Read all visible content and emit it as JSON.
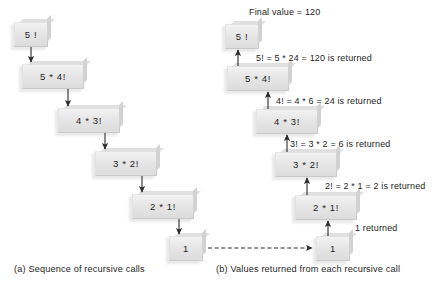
{
  "figure": {
    "title_note": "Final value = 120",
    "panel_a_caption": "(a) Sequence of recursive calls",
    "panel_b_caption": "(b) Values returned from each recursive call"
  },
  "panel_a": {
    "boxes": [
      {
        "label": "5 !"
      },
      {
        "label": "5  *  4!"
      },
      {
        "label": "4  *  3!"
      },
      {
        "label": "3  *  2!"
      },
      {
        "label": "2  *  1!"
      },
      {
        "label": "1"
      }
    ]
  },
  "panel_b": {
    "boxes": [
      {
        "label": "5 !"
      },
      {
        "label": "5  *  4!"
      },
      {
        "label": "4  *  3!"
      },
      {
        "label": "3  *  2!"
      },
      {
        "label": "2  *  1!"
      },
      {
        "label": "1"
      }
    ],
    "returns": [
      {
        "text": "5! = 5 * 24 = 120 is returned"
      },
      {
        "text": "4! = 4 * 6 = 24 is returned"
      },
      {
        "text": "3! = 3 * 2 = 6 is returned"
      },
      {
        "text": "2! = 2 * 1 = 2 is returned"
      },
      {
        "text": "1 returned"
      }
    ]
  },
  "colors": {
    "box_fill": "#e6e6e6",
    "box_border": "#c9c9c9",
    "arrow": "#2b2b2b",
    "text": "#262626",
    "background": "#ffffff"
  }
}
